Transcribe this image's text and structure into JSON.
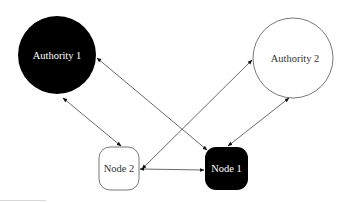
{
  "diagram": {
    "type": "network",
    "colors": {
      "filled": "#000000",
      "outline": "#555555",
      "edge": "#444444",
      "background": "#ffffff"
    },
    "nodes": [
      {
        "id": "authority1",
        "label": "Authority 1",
        "shape": "circle",
        "style": "filled",
        "cx": 57,
        "cy": 55,
        "r": 39
      },
      {
        "id": "authority2",
        "label": "Authority 2",
        "shape": "circle",
        "style": "outline",
        "cx": 293,
        "cy": 58,
        "r": 40
      },
      {
        "id": "node2",
        "label": "Node 2",
        "shape": "rounded-square",
        "style": "outline",
        "x": 99,
        "y": 147,
        "w": 40,
        "h": 43
      },
      {
        "id": "node1",
        "label": "Node 1",
        "shape": "rounded-square",
        "style": "filled",
        "x": 205,
        "y": 147,
        "w": 43,
        "h": 43
      }
    ],
    "edges": [
      {
        "from": "authority1",
        "to": "node2",
        "direction": "both"
      },
      {
        "from": "authority1",
        "to": "node1",
        "direction": "both"
      },
      {
        "from": "authority2",
        "to": "node2",
        "direction": "both"
      },
      {
        "from": "authority2",
        "to": "node1",
        "direction": "both"
      },
      {
        "from": "node2",
        "to": "node1",
        "direction": "both"
      }
    ]
  }
}
